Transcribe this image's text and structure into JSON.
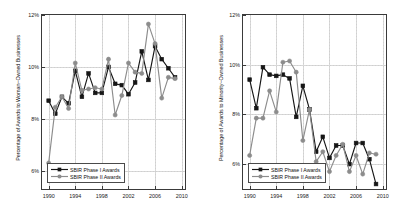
{
  "figure": {
    "background": "#ffffff",
    "series_colors": {
      "phase1": "#161616",
      "phase2": "#8c8c8c"
    }
  },
  "legend": {
    "phase1_label": "SBIR Phase I Awards",
    "phase2_label": "SBIR Phase II Awards"
  },
  "chart_data": [
    {
      "type": "line",
      "title": "",
      "xlabel": "",
      "ylabel": "Percentage of Awards to Woman−Owned Businesses",
      "xlim": [
        1989,
        2010.5
      ],
      "ylim": [
        5.3,
        12.0
      ],
      "xticks": [
        1990,
        1994,
        1998,
        2002,
        2006,
        2010
      ],
      "xticklabels": [
        "1990",
        "1994",
        "1998",
        "2002",
        "2006",
        "2010"
      ],
      "yticks": [
        6,
        8,
        10,
        12
      ],
      "yticklabels": [
        "6%",
        "8%",
        "10%",
        "12%"
      ],
      "grid": true,
      "legend_position": "lower left",
      "x": [
        1990,
        1991,
        1992,
        1993,
        1994,
        1995,
        1996,
        1997,
        1998,
        1999,
        2000,
        2001,
        2002,
        2003,
        2004,
        2005,
        2006,
        2007,
        2008,
        2009
      ],
      "series": [
        {
          "name": "SBIR Phase I Awards",
          "marker": "square",
          "color": "#161616",
          "values": [
            8.7,
            8.2,
            8.85,
            8.6,
            9.85,
            8.85,
            9.75,
            9.0,
            9.0,
            10.0,
            9.35,
            9.3,
            8.95,
            9.4,
            10.6,
            9.5,
            10.8,
            10.3,
            9.95,
            9.6
          ]
        },
        {
          "name": "SBIR Phase II Awards",
          "marker": "circle",
          "color": "#8c8c8c",
          "values": [
            6.3,
            8.45,
            8.85,
            8.4,
            10.15,
            9.1,
            9.15,
            9.2,
            9.15,
            10.3,
            8.15,
            8.9,
            10.15,
            9.8,
            9.75,
            11.65,
            10.9,
            8.8,
            9.6,
            9.55
          ]
        }
      ]
    },
    {
      "type": "line",
      "title": "",
      "xlabel": "",
      "ylabel": "Percentage of Awards to Minority−Owned Businesses",
      "xlim": [
        1989,
        2010.5
      ],
      "ylim": [
        5.0,
        12.0
      ],
      "xticks": [
        1990,
        1994,
        1998,
        2002,
        2006,
        2010
      ],
      "xticklabels": [
        "1990",
        "1994",
        "1998",
        "2002",
        "2006",
        "2010"
      ],
      "yticks": [
        6,
        8,
        10,
        12
      ],
      "yticklabels": [
        "6%",
        "8%",
        "10%",
        "12%"
      ],
      "grid": true,
      "legend_position": "lower left",
      "x": [
        1990,
        1991,
        1992,
        1993,
        1994,
        1995,
        1996,
        1997,
        1998,
        1999,
        2000,
        2001,
        2002,
        2003,
        2004,
        2005,
        2006,
        2007,
        2008,
        2009
      ],
      "series": [
        {
          "name": "SBIR Phase I Awards",
          "marker": "square",
          "color": "#161616",
          "values": [
            9.4,
            8.25,
            9.9,
            9.6,
            9.55,
            9.6,
            9.45,
            7.9,
            9.15,
            8.2,
            6.5,
            7.1,
            6.25,
            6.75,
            6.75,
            6.0,
            6.85,
            6.85,
            6.2,
            5.2
          ]
        },
        {
          "name": "SBIR Phase II Awards",
          "marker": "circle",
          "color": "#8c8c8c",
          "values": [
            6.35,
            7.85,
            7.85,
            8.95,
            8.1,
            10.1,
            10.15,
            9.7,
            6.95,
            8.2,
            6.1,
            6.5,
            5.7,
            6.35,
            6.8,
            5.7,
            6.35,
            5.6,
            6.45,
            6.4
          ]
        }
      ]
    }
  ]
}
